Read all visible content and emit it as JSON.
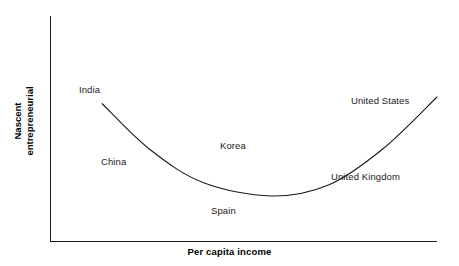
{
  "chart_data": {
    "type": "line",
    "title": "",
    "subtitle": "",
    "xlabel": "Per capita income",
    "ylabel": "Nascent entrepreneurial",
    "ylabel_lines": [
      "Nascent",
      "entrepreneurial"
    ],
    "grid": false,
    "legend": "none",
    "axes": {
      "x_axis_ticks": [],
      "y_axis_ticks": [],
      "x_axis_range_note": "unlabeled, increasing left to right",
      "y_axis_range_note": "unlabeled, increasing bottom to top"
    },
    "curve_description": "U-shaped (quadratic) curve: nascent entrepreneurial activity is high at low per capita income, falls to a minimum at middle income, then rises again at high income",
    "series": [
      {
        "name": "Nascent entrepreneurial activity",
        "color": "#1a1a1a",
        "points": [
          {
            "x": 0.07,
            "y": 0.61
          },
          {
            "x": 0.2,
            "y": 0.41
          },
          {
            "x": 0.35,
            "y": 0.26
          },
          {
            "x": 0.54,
            "y": 0.2
          },
          {
            "x": 0.7,
            "y": 0.25
          },
          {
            "x": 0.85,
            "y": 0.41
          },
          {
            "x": 1.0,
            "y": 0.64
          }
        ]
      }
    ],
    "annotations": [
      {
        "label": "India",
        "x": 0.08,
        "y": 0.68,
        "position": "upper-left"
      },
      {
        "label": "China",
        "x": 0.14,
        "y": 0.36,
        "position": "left-lower"
      },
      {
        "label": "Korea",
        "x": 0.45,
        "y": 0.42,
        "position": "center"
      },
      {
        "label": "Spain",
        "x": 0.42,
        "y": 0.12,
        "position": "below-minimum"
      },
      {
        "label": "United Kingdom",
        "x": 0.74,
        "y": 0.25,
        "position": "right-lower"
      },
      {
        "label": "United States",
        "x": 0.79,
        "y": 0.6,
        "position": "upper-right"
      }
    ]
  },
  "labels": {
    "india": "India",
    "china": "China",
    "korea": "Korea",
    "spain": "Spain",
    "united_kingdom": "United Kingdom",
    "united_states": "United States"
  },
  "axis_titles": {
    "x": "Per capita income",
    "y_line1": "Nascent",
    "y_line2": "entrepreneurial"
  },
  "colors": {
    "curve": "#1a1a1a",
    "axis": "#1a1a1a",
    "text": "#1a1a1a",
    "background": "#ffffff"
  }
}
